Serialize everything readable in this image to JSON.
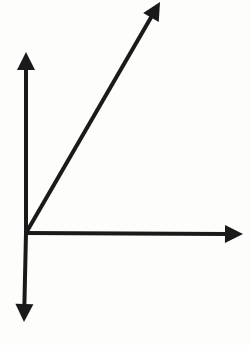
{
  "diagram": {
    "stroke_color": "#1a1a1a",
    "background": "#fdfdfb",
    "stroke_width": 4,
    "vertex": {
      "x": 26,
      "y": 233
    },
    "rays": [
      {
        "name": "vertical-up-ray",
        "from": [
          26,
          233
        ],
        "to": [
          26,
          52
        ]
      },
      {
        "name": "vertical-down-ray",
        "from": [
          26,
          233
        ],
        "to": [
          24,
          322
        ]
      },
      {
        "name": "horizontal-ray",
        "from": [
          26,
          233
        ],
        "to": [
          243,
          234
        ]
      },
      {
        "name": "diagonal-ray",
        "from": [
          26,
          233
        ],
        "to": [
          160,
          2
        ]
      }
    ]
  }
}
